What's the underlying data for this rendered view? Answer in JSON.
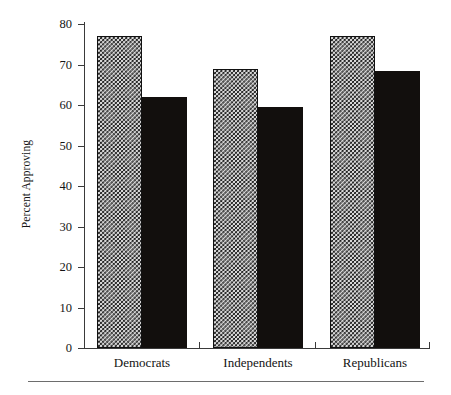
{
  "chart_data": {
    "type": "bar",
    "title": "",
    "subtitle": "",
    "xlabel": "",
    "ylabel": "Percent Approving",
    "categories": [
      "Democrats",
      "Independents",
      "Republicans"
    ],
    "series": [
      {
        "name": "series-1",
        "pattern": "checkerboard",
        "values": [
          77,
          69,
          77
        ]
      },
      {
        "name": "series-2",
        "pattern": "solid-black",
        "values": [
          62,
          59.5,
          68.5
        ]
      }
    ],
    "ylim": [
      0,
      80
    ],
    "ytick_values": [
      0,
      10,
      20,
      30,
      40,
      50,
      60,
      70,
      80
    ],
    "ytick_labels": [
      "0",
      "10",
      "20",
      "30",
      "40",
      "50",
      "60",
      "70",
      "80"
    ],
    "grid": false,
    "legend": "none",
    "colors": {
      "axis": "#3a3a3a",
      "text": "#141414",
      "series_1_fill": "#d8d8d8",
      "series_1_pattern": "#1c1c1c",
      "series_2_fill": "#120f0d",
      "background": "#ffffff",
      "rule": "#6d6d6d"
    }
  },
  "axis": {
    "y_title": "Percent Approving"
  }
}
